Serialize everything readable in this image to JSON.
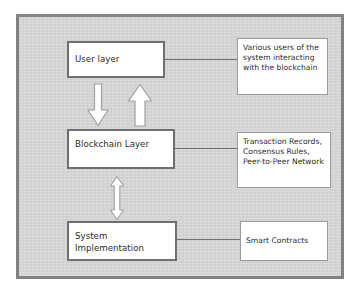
{
  "diagram": {
    "colors": {
      "frame_fill": "#d3d3d3",
      "frame_border": "#818181",
      "box_fill": "#ffffff",
      "layer_box_border": "#6f6f6f",
      "note_box_border": "#9a9a9a",
      "text": "#2b2b2b",
      "connector": "#6f6f6f"
    },
    "layers": [
      {
        "id": "user-layer",
        "label": "User layer"
      },
      {
        "id": "blockchain-layer",
        "label": "Blockchain Layer"
      },
      {
        "id": "system-implementation",
        "label": "System Implementation"
      }
    ],
    "notes": [
      {
        "id": "user-layer-note",
        "label": "Various users of the system interacting with the blockchain"
      },
      {
        "id": "blockchain-layer-note",
        "label": "Transaction Records, Consensus Rules, Peer-to-Peer Network"
      },
      {
        "id": "system-implementation-note",
        "label": "Smart Contracts"
      }
    ],
    "connectors": [
      {
        "id": "user-layer-to-note"
      },
      {
        "id": "blockchain-layer-to-note"
      },
      {
        "id": "system-implementation-to-note"
      }
    ],
    "arrows": [
      {
        "id": "user-to-blockchain-arrow",
        "direction": "down"
      },
      {
        "id": "blockchain-to-user-arrow",
        "direction": "up"
      },
      {
        "id": "blockchain-to-system-arrow",
        "direction": "up-down"
      }
    ]
  }
}
